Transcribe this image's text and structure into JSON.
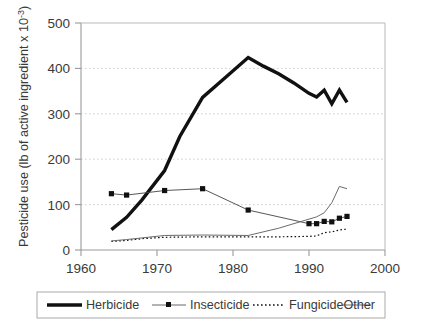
{
  "chart_data": {
    "type": "line",
    "title": "",
    "xlabel": "",
    "ylabel_parts": {
      "main": "Pesticide use (lb of active ingredient x 10",
      "exponent": "-3",
      "close": ")"
    },
    "ylabel": "Pesticide use (lb of active ingredient x 10^-3)",
    "xlim": [
      1960,
      2000
    ],
    "ylim": [
      0,
      500
    ],
    "xticks": [
      1960,
      1970,
      1980,
      1990,
      2000
    ],
    "xtick_labels": [
      "1960",
      "1970",
      "1980",
      "1990",
      "2000"
    ],
    "yticks": [
      0,
      100,
      200,
      300,
      400,
      500
    ],
    "ytick_labels": [
      "0",
      "100",
      "200",
      "300",
      "400",
      "500"
    ],
    "grid": "horizontal-dotted",
    "legend_position": "bottom-outside",
    "series": [
      {
        "name": "Herbicide",
        "style": "thick-solid",
        "color": "#111111",
        "width": 3.4,
        "marker": "none",
        "x": [
          1964,
          1966,
          1968,
          1971,
          1973,
          1976,
          1979,
          1982,
          1984,
          1986,
          1988,
          1990,
          1991,
          1992,
          1993,
          1994,
          1995
        ],
        "y": [
          45,
          72,
          110,
          175,
          250,
          336,
          380,
          424,
          405,
          388,
          368,
          345,
          337,
          352,
          322,
          352,
          325
        ]
      },
      {
        "name": "Insecticide",
        "style": "thin-solid-marker",
        "color": "#444444",
        "width": 0.9,
        "marker": "square",
        "marker_color": "#111111",
        "x": [
          1964,
          1966,
          1971,
          1976,
          1982,
          1990,
          1991,
          1992,
          1993,
          1994,
          1995
        ],
        "y": [
          124,
          121,
          131,
          135,
          88,
          58,
          58,
          63,
          62,
          70,
          74
        ]
      },
      {
        "name": "Fungicide",
        "style": "dotted",
        "color": "#111111",
        "width": 1.2,
        "marker": "none",
        "x": [
          1964,
          1966,
          1968,
          1971,
          1976,
          1982,
          1986,
          1990,
          1991,
          1992,
          1993,
          1994,
          1995
        ],
        "y": [
          19,
          21,
          25,
          28,
          29,
          29,
          29,
          30,
          31,
          38,
          40,
          44,
          46
        ]
      },
      {
        "name": "Other",
        "style": "thin-solid",
        "color": "#6b6b6b",
        "width": 1.0,
        "marker": "none",
        "x": [
          1964,
          1966,
          1971,
          1976,
          1982,
          1986,
          1990,
          1991,
          1992,
          1993,
          1994,
          1995
        ],
        "y": [
          20,
          23,
          32,
          33,
          32,
          48,
          68,
          73,
          82,
          104,
          140,
          135
        ]
      }
    ]
  },
  "legend": {
    "items": [
      {
        "label": "Herbicide",
        "swatch": "thick-solid-swatch"
      },
      {
        "label": "Insecticide",
        "swatch": "marker-line-swatch"
      },
      {
        "label": "Fungicide",
        "swatch": "dotted-swatch"
      },
      {
        "label": "Other",
        "swatch": "thin-solid-swatch"
      }
    ]
  }
}
